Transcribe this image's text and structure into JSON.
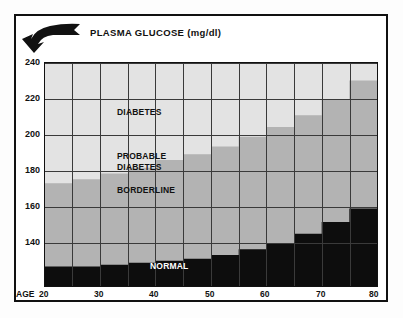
{
  "header": {
    "title": "PLASMA GLUCOSE (mg/dl)",
    "banner_icon": "curved-arrow-banner-icon"
  },
  "axis": {
    "age_prefix": "AGE",
    "y_ticks": [
      "240",
      "220",
      "200",
      "180",
      "160",
      "140"
    ],
    "x_ticks": [
      "20",
      "30",
      "40",
      "50",
      "60",
      "70",
      "80"
    ]
  },
  "bands": [
    {
      "key": "diabetes",
      "label": "DIABETES",
      "color": "#e3e3e3"
    },
    {
      "key": "probable_diabetes",
      "label": "PROBABLE\nDIABETES",
      "color": "#e3e3e3"
    },
    {
      "key": "borderline",
      "label": "BORDERLINE",
      "color": "#b3b3b3"
    },
    {
      "key": "normal",
      "label": "NORMAL",
      "color": "#0d0d0d"
    }
  ],
  "chart_data": {
    "type": "area",
    "title": "PLASMA GLUCOSE (mg/dl)",
    "xlabel": "AGE",
    "ylabel": "PLASMA GLUCOSE (mg/dl)",
    "xlim": [
      20,
      80
    ],
    "ylim": [
      130,
      245
    ],
    "ytick_values": [
      140,
      160,
      180,
      200,
      220,
      240
    ],
    "xtick_values": [
      20,
      30,
      40,
      50,
      60,
      70,
      80
    ],
    "grid": true,
    "legend": "inline-band-labels",
    "x_bins": [
      [
        20,
        25
      ],
      [
        25,
        30
      ],
      [
        30,
        35
      ],
      [
        35,
        40
      ],
      [
        40,
        45
      ],
      [
        45,
        50
      ],
      [
        50,
        55
      ],
      [
        55,
        60
      ],
      [
        60,
        65
      ],
      [
        65,
        70
      ],
      [
        70,
        75
      ],
      [
        75,
        80
      ]
    ],
    "series": [
      {
        "name": "NORMAL",
        "region": "below",
        "color": "#0d0d0d",
        "description": "Upper limit of NORMAL plasma glucose per age bin (mg/dl)",
        "values": [
          140,
          140,
          141,
          142,
          143,
          144,
          146,
          149,
          152,
          157,
          163,
          170
        ]
      },
      {
        "name": "BORDERLINE",
        "region": "band",
        "color": "#b3b3b3",
        "description": "Upper limit of BORDERLINE plasma glucose per age bin (mg/dl)",
        "values": [
          183,
          185,
          188,
          191,
          195,
          198,
          202,
          207,
          212,
          218,
          226,
          236
        ]
      },
      {
        "name": "PROBABLE DIABETES / DIABETES",
        "region": "band",
        "color": "#e3e3e3",
        "description": "Region above the BORDERLINE boundary; PROBABLE DIABETES lower portion, DIABETES upper portion",
        "values": [
          245,
          245,
          245,
          245,
          245,
          245,
          245,
          245,
          245,
          245,
          245,
          245
        ]
      }
    ]
  }
}
